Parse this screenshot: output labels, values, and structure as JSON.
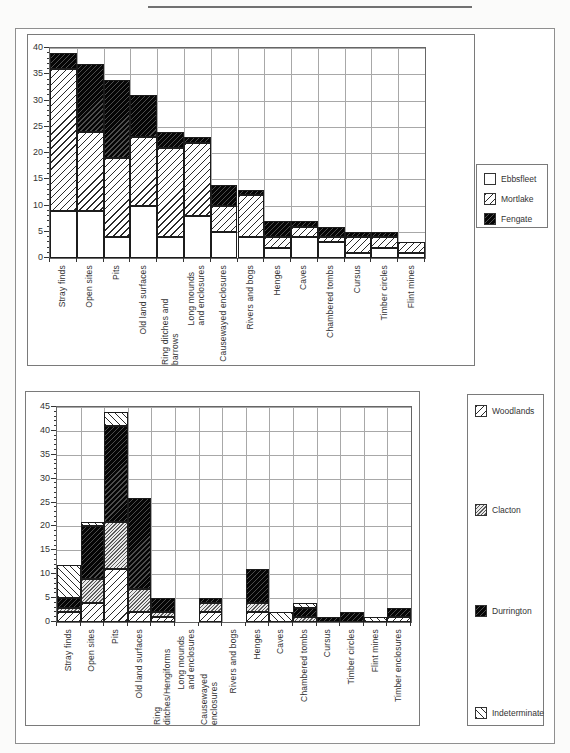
{
  "style": {
    "ink": "#1a1a1a",
    "grid_color": "#a8a8a8",
    "frame_color": "#8f8f8f",
    "paper": "#ffffff"
  },
  "chart_data": [
    {
      "type": "bar",
      "variant": "stacked-vertical",
      "title": "",
      "xlabel": "",
      "ylabel": "",
      "ylim": [
        0,
        40
      ],
      "ytick_step": 5,
      "ytick_labels": [
        "0",
        "5",
        "10",
        "15",
        "20",
        "25",
        "30",
        "35",
        "40"
      ],
      "grid": true,
      "legend_position": "right",
      "categories": [
        "Stray finds",
        "Open sites",
        "Pits",
        "Old land surfaces",
        "Ring ditches and barrows",
        "Long mounds\nand enclosures",
        "Causewayed enclosures",
        "Rivers and bogs",
        "Henges",
        "Caves",
        "Chambered tombs",
        "Cursus",
        "Timber circles",
        "Flint mines"
      ],
      "series": [
        {
          "name": "Ebbsfleet",
          "pattern": "white",
          "values": [
            9,
            9,
            4,
            10,
            4,
            8,
            5,
            4,
            2,
            4,
            3,
            1,
            2,
            1
          ]
        },
        {
          "name": "Mortlake",
          "pattern": "hatch-fwd",
          "values": [
            27,
            15,
            15,
            13,
            17,
            14,
            5,
            8,
            2,
            2,
            1,
            3,
            2,
            2
          ]
        },
        {
          "name": "Fengate",
          "pattern": "dark",
          "values": [
            3,
            13,
            15,
            8,
            3,
            1,
            4,
            1,
            3,
            1,
            2,
            1,
            1,
            0
          ]
        }
      ]
    },
    {
      "type": "bar",
      "variant": "stacked-vertical",
      "title": "",
      "xlabel": "",
      "ylabel": "",
      "ylim": [
        0,
        45
      ],
      "ytick_step": 5,
      "ytick_labels": [
        "0",
        "5",
        "10",
        "15",
        "20",
        "25",
        "30",
        "35",
        "40",
        "45"
      ],
      "grid": true,
      "legend_position": "right",
      "categories": [
        "Stray finds",
        "Open sites",
        "Pits",
        "Old land surfaces",
        "Ring ditches/Hengiforms",
        "Long mounds\nand enclosures",
        "Causewayed enclosures",
        "Rivers and bogs",
        "Henges",
        "Caves",
        "Chambered tombs",
        "Cursus",
        "Timber circles",
        "Flint mines",
        "Timber enclosures"
      ],
      "series": [
        {
          "name": "Woodlands",
          "pattern": "hatch-fwd",
          "values": [
            2,
            4,
            11,
            2,
            1,
            0,
            2,
            0,
            2,
            0,
            0,
            0,
            0,
            0,
            1
          ]
        },
        {
          "name": "Clacton",
          "pattern": "hatch-fine",
          "values": [
            1,
            5,
            10,
            5,
            1,
            0,
            2,
            0,
            2,
            0,
            1,
            0,
            0,
            0,
            0
          ]
        },
        {
          "name": "Durrington",
          "pattern": "dark",
          "values": [
            2,
            11,
            20,
            19,
            3,
            0,
            1,
            0,
            7,
            0,
            2,
            1,
            2,
            0,
            2
          ]
        },
        {
          "name": "Indeterminate",
          "pattern": "hatch-back",
          "values": [
            7,
            1,
            3,
            0,
            0,
            0,
            0,
            0,
            0,
            2,
            1,
            0,
            0,
            1,
            0
          ]
        }
      ]
    }
  ]
}
